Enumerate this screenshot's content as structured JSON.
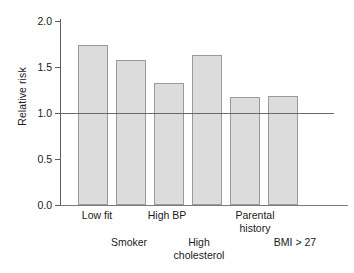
{
  "chart_data": {
    "type": "bar",
    "title": "",
    "subtitle": "",
    "xlabel": "",
    "ylabel": "Relative risk",
    "categories": [
      "Low fit",
      "Smoker",
      "High BP",
      "High cholesterol",
      "Parental history",
      "BMI > 27"
    ],
    "values": [
      1.74,
      1.58,
      1.33,
      1.63,
      1.17,
      1.18
    ],
    "ylim": [
      0.0,
      2.0
    ],
    "ytick_labels": [
      "0.0",
      "0.5",
      "1.0",
      "1.5",
      "2.0"
    ],
    "ytick_values": [
      0.0,
      0.5,
      1.0,
      1.5,
      2.0
    ],
    "grid": false,
    "legend": false,
    "legend_position": "none",
    "annotations": [
      {
        "type": "reference-line",
        "orientation": "horizontal",
        "value": 1.0,
        "label": ""
      }
    ],
    "bar_fill_color": "#dcdcdc",
    "bar_edge_color": "#9a9a9a",
    "axis_color": "#5d5d5d",
    "reference_line_color": "#6a6a6a",
    "label_rows": [
      0,
      1,
      0,
      1,
      0,
      1
    ]
  }
}
